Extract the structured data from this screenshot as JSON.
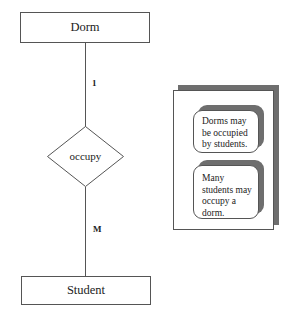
{
  "diagram": {
    "type": "ER diagram",
    "entities": [
      {
        "name": "Dorm"
      },
      {
        "name": "Student"
      }
    ],
    "relationship": {
      "name": "occupy"
    },
    "cardinalities": {
      "dorm_side": "1",
      "student_side": "M"
    },
    "notes": [
      {
        "text": "Dorms may be occupied by students."
      },
      {
        "text": "Many students may occupy a dorm."
      }
    ],
    "colors": {
      "stroke": "#555555",
      "shadow": "#6e6e6e",
      "background": "#ffffff"
    }
  }
}
